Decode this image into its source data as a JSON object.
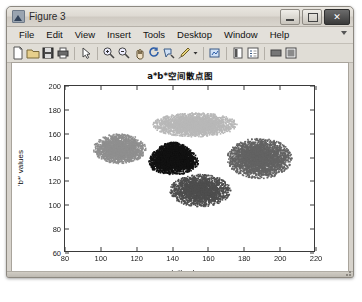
{
  "window": {
    "title": "Figure 3",
    "app_icon": "matlab-figure-icon",
    "controls": [
      {
        "name": "minimize-button",
        "glyph": "–"
      },
      {
        "name": "maximize-button",
        "glyph": "□"
      },
      {
        "name": "close-button",
        "glyph": "✕"
      }
    ]
  },
  "menubar": {
    "items": [
      {
        "label": "File"
      },
      {
        "label": "Edit"
      },
      {
        "label": "View"
      },
      {
        "label": "Insert"
      },
      {
        "label": "Tools"
      },
      {
        "label": "Desktop"
      },
      {
        "label": "Window"
      },
      {
        "label": "Help"
      }
    ],
    "overflow_icon": "chevron-down-icon"
  },
  "toolbar": {
    "buttons": [
      {
        "name": "new-figure-icon",
        "tip": "New Figure"
      },
      {
        "name": "open-file-icon",
        "tip": "Open File"
      },
      {
        "name": "save-figure-icon",
        "tip": "Save Figure"
      },
      {
        "name": "print-figure-icon",
        "tip": "Print Figure"
      },
      {
        "name": "pointer-icon",
        "tip": "Edit Plot"
      },
      {
        "name": "zoom-in-icon",
        "tip": "Zoom In"
      },
      {
        "name": "zoom-out-icon",
        "tip": "Zoom Out"
      },
      {
        "name": "pan-icon",
        "tip": "Pan"
      },
      {
        "name": "rotate-3d-icon",
        "tip": "Rotate 3D"
      },
      {
        "name": "data-cursor-icon",
        "tip": "Data Cursor"
      },
      {
        "name": "brush-icon",
        "tip": "Brush/Select Data"
      },
      {
        "name": "brush-dropdown-icon",
        "tip": "Brush Options"
      },
      {
        "name": "link-data-icon",
        "tip": "Link Plot"
      },
      {
        "name": "insert-colorbar-icon",
        "tip": "Insert Colorbar"
      },
      {
        "name": "insert-legend-icon",
        "tip": "Insert Legend"
      },
      {
        "name": "hide-plot-tools-icon",
        "tip": "Hide Plot Tools"
      },
      {
        "name": "show-plot-tools-icon",
        "tip": "Show Plot Tools and Dock Figure"
      }
    ]
  },
  "chart_data": {
    "type": "scatter",
    "title": "a*b*空间散点图",
    "xlabel": "'a*' values",
    "ylabel": "'b*' values",
    "xlim": [
      80,
      220
    ],
    "ylim": [
      60,
      200
    ],
    "xticks": [
      80,
      100,
      120,
      140,
      160,
      180,
      200,
      220
    ],
    "yticks": [
      60,
      80,
      100,
      120,
      140,
      160,
      180,
      200
    ],
    "grid": false,
    "legend": null,
    "marker": ".",
    "marker_size": 1.6,
    "colormap": "grayscale",
    "clusters": [
      {
        "name": "cluster-light-gray-top",
        "color": "#b8b8b8",
        "n": 2600,
        "center": [
          152,
          168
        ],
        "spread": [
          21,
          9
        ],
        "shape": "ellipse"
      },
      {
        "name": "cluster-mid-gray-left",
        "color": "#8f8f8f",
        "n": 2100,
        "center": [
          110,
          148
        ],
        "spread": [
          13,
          11
        ],
        "shape": "ellipse"
      },
      {
        "name": "cluster-black-center",
        "color": "#121212",
        "n": 3400,
        "center": [
          140,
          140
        ],
        "spread": [
          15,
          12
        ],
        "shape": "wedge"
      },
      {
        "name": "cluster-dark-gray-right",
        "color": "#636363",
        "n": 3000,
        "center": [
          188,
          140
        ],
        "spread": [
          16,
          15
        ],
        "shape": "ellipse"
      },
      {
        "name": "cluster-dark-gray-bottom",
        "color": "#4e4e4e",
        "n": 2200,
        "center": [
          155,
          113
        ],
        "spread": [
          15,
          12
        ],
        "shape": "ellipse"
      }
    ]
  }
}
